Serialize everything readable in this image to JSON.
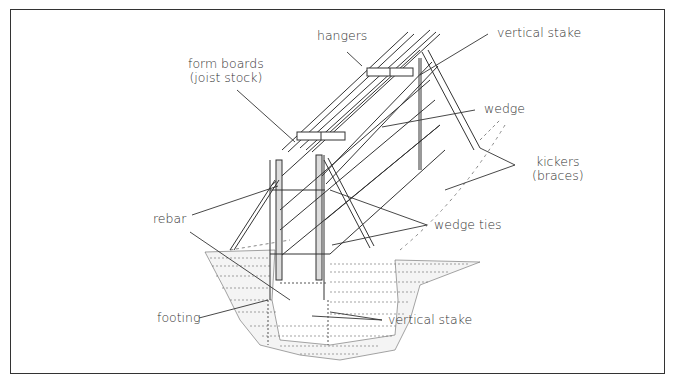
{
  "diagram": {
    "title": "",
    "type": "labeled technical illustration",
    "labels": {
      "hangers": "hangers",
      "vertical_stake_top": "vertical stake",
      "form_boards_line1": "form boards",
      "form_boards_line2": "(joist stock)",
      "wedge": "wedge",
      "kickers_line1": "kickers",
      "kickers_line2": "(braces)",
      "rebar": "rebar",
      "wedge_ties": "wedge ties",
      "footing": "footing",
      "vertical_stake_bottom": "vertical stake"
    },
    "colors": {
      "ink": "#333333",
      "background": "#ffffff",
      "frame": "#333333"
    }
  }
}
